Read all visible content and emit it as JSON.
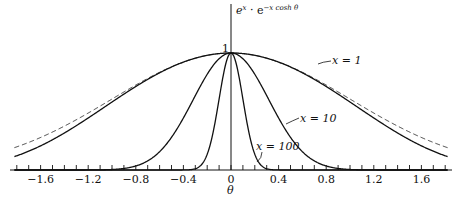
{
  "chart_data": {
    "type": "line",
    "title": "",
    "ylabel": "e^x · e^{-x cosh θ}",
    "xlabel": "θ",
    "xlim": [
      -1.82,
      1.82
    ],
    "ylim": [
      0,
      1
    ],
    "grid": false,
    "x_ticks_major": [
      -1.6,
      -1.2,
      -0.8,
      -0.4,
      0,
      0.4,
      0.8,
      1.2,
      1.6
    ],
    "x_tick_labels": [
      "−1.6",
      "−1.2",
      "−0.8",
      "−0.4",
      "0",
      "0.4",
      "0.8",
      "1.2",
      "1.6"
    ],
    "x_tick_minor_step": 0.1,
    "y_peak_label": "1",
    "series": [
      {
        "name": "x=1",
        "label": "x = 1",
        "style": "solid",
        "function": "exp(x*(1-cosh(theta)))",
        "x_param": 1
      },
      {
        "name": "x=10",
        "label": "x = 10",
        "style": "solid",
        "function": "exp(x*(1-cosh(theta)))",
        "x_param": 10
      },
      {
        "name": "x=100",
        "label": "x = 100",
        "style": "solid",
        "function": "exp(x*(1-cosh(theta)))",
        "x_param": 100
      },
      {
        "name": "gaussian approx (x=1)",
        "label": "",
        "style": "dashed",
        "function": "exp(-x*theta^2/2)",
        "x_param": 1
      }
    ]
  },
  "labels": {
    "y_axis": "e^x · e^{-x cosh θ}",
    "y_axis_base": "e",
    "y_axis_sup1": "x",
    "y_axis_mid": " · e",
    "y_axis_sup2": "−x cosh θ",
    "x_axis": "θ",
    "peak": "1",
    "x1": "x = 1",
    "x10": "x = 10",
    "x100": "x = 100"
  }
}
